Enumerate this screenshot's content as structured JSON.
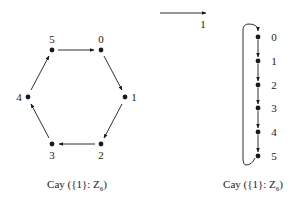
{
  "diagram": {
    "type": "cayley-graph-comparison",
    "top_arrow": {
      "label": "1"
    },
    "left_graph": {
      "caption_prefix": "Cay ({1}: Z",
      "caption_sub": "6",
      "caption_suffix": ")",
      "layout": "hexagon-cycle",
      "nodes": [
        {
          "id": "0",
          "label": "0",
          "x": 101,
          "y": 50,
          "lx": 101,
          "ly": 39
        },
        {
          "id": "1",
          "label": "1",
          "x": 125,
          "y": 97,
          "lx": 134,
          "ly": 97
        },
        {
          "id": "2",
          "label": "2",
          "x": 101,
          "y": 144,
          "lx": 101,
          "ly": 155
        },
        {
          "id": "3",
          "label": "3",
          "x": 52,
          "y": 144,
          "lx": 52,
          "ly": 155
        },
        {
          "id": "4",
          "label": "4",
          "x": 28,
          "y": 97,
          "lx": 19,
          "ly": 97
        },
        {
          "id": "5",
          "label": "5",
          "x": 52,
          "y": 50,
          "lx": 52,
          "ly": 39
        }
      ],
      "edges": [
        [
          "5",
          "0"
        ],
        [
          "0",
          "1"
        ],
        [
          "1",
          "2"
        ],
        [
          "2",
          "3"
        ],
        [
          "3",
          "4"
        ],
        [
          "4",
          "5"
        ]
      ]
    },
    "right_graph": {
      "caption_prefix": "Cay ({1}: Z",
      "caption_sub": "6",
      "caption_suffix": ")",
      "layout": "vertical-chain-with-loop",
      "nodes": [
        {
          "id": "0",
          "label": "0",
          "x": 258,
          "y": 37
        },
        {
          "id": "1",
          "label": "1",
          "x": 258,
          "y": 61
        },
        {
          "id": "2",
          "label": "2",
          "x": 258,
          "y": 85
        },
        {
          "id": "3",
          "label": "3",
          "x": 258,
          "y": 108
        },
        {
          "id": "4",
          "label": "4",
          "x": 258,
          "y": 132
        },
        {
          "id": "5",
          "label": "5",
          "x": 258,
          "y": 156
        }
      ],
      "edges": [
        [
          "0",
          "1"
        ],
        [
          "1",
          "2"
        ],
        [
          "2",
          "3"
        ],
        [
          "3",
          "4"
        ],
        [
          "4",
          "5"
        ],
        [
          "5",
          "0"
        ]
      ]
    }
  }
}
